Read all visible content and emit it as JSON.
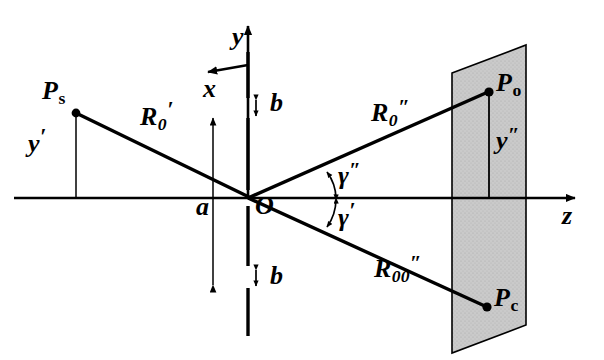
{
  "figure": {
    "type": "optics-geometry-diagram",
    "background_color": "#ffffff",
    "line_color": "#000000",
    "plane_fill_color": "#c8c8c8",
    "axes": {
      "z_label": "z",
      "y_label": "y",
      "x_label": "x"
    },
    "origin": {
      "label": "O"
    },
    "points": {
      "source": {
        "label_main": "P",
        "label_sub": "s"
      },
      "object": {
        "label_main": "P",
        "label_sub": "o"
      },
      "conjugate": {
        "label_main": "P",
        "label_sub": "c"
      }
    },
    "distances": {
      "source_height": {
        "main": "y",
        "prime": "′"
      },
      "image_height": {
        "main": "y",
        "prime": "″"
      },
      "aperture_a": {
        "main": "a"
      },
      "aperture_b_top": {
        "main": "b"
      },
      "aperture_b_bottom": {
        "main": "b"
      }
    },
    "rays": {
      "incident": {
        "main": "R",
        "sub": "0",
        "prime": "′"
      },
      "diffracted": {
        "main": "R",
        "sub": "0",
        "prime": "″"
      },
      "reference": {
        "main": "R",
        "sub": "00",
        "prime": "″"
      }
    },
    "angles": {
      "gamma_double_prime": {
        "main": "γ",
        "prime": "″"
      },
      "gamma_prime": {
        "main": "γ",
        "prime": "′"
      }
    }
  }
}
